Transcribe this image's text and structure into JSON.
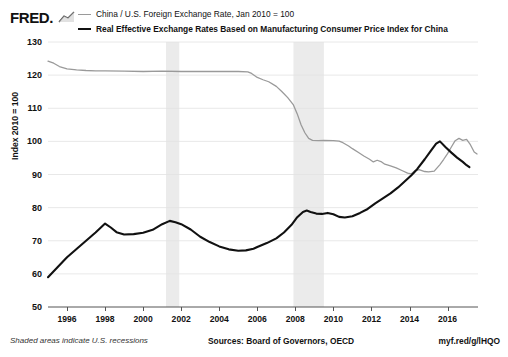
{
  "brand": {
    "name": "FRED.",
    "mark_icon": "trend-line-icon"
  },
  "legend": {
    "items": [
      {
        "label": "China / U.S. Foreign Exchange Rate, Jan 2010 = 100",
        "color": "#9a9a9a",
        "style": "thin"
      },
      {
        "label": "Real Effective Exchange Rates Based on Manufacturing Consumer Price Index for China",
        "color": "#111111",
        "style": "thick"
      }
    ]
  },
  "footer": {
    "recession_note": "Shaded areas indicate U.S. recessions",
    "sources": "Sources: Board of Governors, OECD",
    "permalink": "myf.red/g/lHQO"
  },
  "chart_data": {
    "type": "line",
    "title": "",
    "xlabel": "",
    "ylabel": "Index 2010 = 100",
    "ylim": [
      50,
      130
    ],
    "yticks": [
      50,
      60,
      70,
      80,
      90,
      100,
      110,
      120,
      130
    ],
    "xlim": [
      1995.0,
      2017.6
    ],
    "xticks": [
      1996,
      1998,
      2000,
      2002,
      2004,
      2006,
      2008,
      2010,
      2012,
      2014,
      2016
    ],
    "grid": true,
    "legend_position": "top",
    "shaded_regions": [
      {
        "label": "U.S. recession 2001",
        "x0": 2001.2,
        "x1": 2001.9,
        "color": "#ebebeb"
      },
      {
        "label": "U.S. recession 2007-2009",
        "x0": 2007.9,
        "x1": 2009.5,
        "color": "#ebebeb"
      }
    ],
    "series": [
      {
        "name": "China / U.S. Foreign Exchange Rate, Jan 2010 = 100",
        "color": "#9a9a9a",
        "width": 1.3,
        "points": [
          [
            1995.0,
            124.2
          ],
          [
            1995.3,
            123.6
          ],
          [
            1995.6,
            122.6
          ],
          [
            1996.0,
            121.9
          ],
          [
            1996.5,
            121.6
          ],
          [
            1997.0,
            121.4
          ],
          [
            1997.5,
            121.3
          ],
          [
            1998.0,
            121.3
          ],
          [
            1999.0,
            121.2
          ],
          [
            2000.0,
            121.1
          ],
          [
            2001.0,
            121.2
          ],
          [
            2002.0,
            121.1
          ],
          [
            2003.0,
            121.1
          ],
          [
            2004.0,
            121.1
          ],
          [
            2005.0,
            121.1
          ],
          [
            2005.5,
            121.0
          ],
          [
            2005.7,
            120.5
          ],
          [
            2006.0,
            119.3
          ],
          [
            2006.3,
            118.6
          ],
          [
            2006.6,
            118.0
          ],
          [
            2007.0,
            116.6
          ],
          [
            2007.3,
            115.0
          ],
          [
            2007.6,
            113.2
          ],
          [
            2007.9,
            111.0
          ],
          [
            2008.1,
            108.3
          ],
          [
            2008.3,
            105.0
          ],
          [
            2008.5,
            102.6
          ],
          [
            2008.7,
            100.9
          ],
          [
            2008.9,
            100.3
          ],
          [
            2009.2,
            100.2
          ],
          [
            2009.5,
            100.3
          ],
          [
            2010.0,
            100.2
          ],
          [
            2010.3,
            100.1
          ],
          [
            2010.5,
            99.6
          ],
          [
            2010.8,
            98.6
          ],
          [
            2011.0,
            97.8
          ],
          [
            2011.3,
            96.7
          ],
          [
            2011.6,
            95.6
          ],
          [
            2011.9,
            94.6
          ],
          [
            2012.1,
            93.8
          ],
          [
            2012.3,
            94.3
          ],
          [
            2012.5,
            93.9
          ],
          [
            2012.7,
            93.1
          ],
          [
            2013.0,
            92.6
          ],
          [
            2013.3,
            92.0
          ],
          [
            2013.6,
            91.2
          ],
          [
            2013.9,
            90.4
          ],
          [
            2014.1,
            90.2
          ],
          [
            2014.3,
            91.2
          ],
          [
            2014.5,
            91.5
          ],
          [
            2014.8,
            90.9
          ],
          [
            2015.0,
            90.8
          ],
          [
            2015.3,
            91.0
          ],
          [
            2015.6,
            93.0
          ],
          [
            2015.8,
            94.6
          ],
          [
            2016.0,
            96.3
          ],
          [
            2016.2,
            98.3
          ],
          [
            2016.4,
            100.2
          ],
          [
            2016.6,
            100.9
          ],
          [
            2016.8,
            100.3
          ],
          [
            2017.0,
            100.6
          ],
          [
            2017.2,
            99.0
          ],
          [
            2017.4,
            96.8
          ],
          [
            2017.55,
            96.2
          ]
        ]
      },
      {
        "name": "Real Effective Exchange Rates Based on Manufacturing Consumer Price Index for China",
        "color": "#111111",
        "width": 2.1,
        "points": [
          [
            1995.0,
            59.0
          ],
          [
            1995.5,
            62.0
          ],
          [
            1996.0,
            65.0
          ],
          [
            1996.5,
            67.5
          ],
          [
            1997.0,
            70.0
          ],
          [
            1997.5,
            72.5
          ],
          [
            1998.0,
            75.2
          ],
          [
            1998.3,
            74.0
          ],
          [
            1998.6,
            72.6
          ],
          [
            1999.0,
            71.9
          ],
          [
            1999.5,
            72.0
          ],
          [
            2000.0,
            72.4
          ],
          [
            2000.5,
            73.3
          ],
          [
            2001.0,
            75.0
          ],
          [
            2001.4,
            76.0
          ],
          [
            2001.7,
            75.6
          ],
          [
            2002.0,
            75.0
          ],
          [
            2002.5,
            73.4
          ],
          [
            2003.0,
            71.2
          ],
          [
            2003.5,
            69.6
          ],
          [
            2004.0,
            68.3
          ],
          [
            2004.5,
            67.4
          ],
          [
            2005.0,
            67.0
          ],
          [
            2005.4,
            67.1
          ],
          [
            2005.8,
            67.6
          ],
          [
            2006.0,
            68.1
          ],
          [
            2006.5,
            69.3
          ],
          [
            2007.0,
            70.7
          ],
          [
            2007.4,
            72.5
          ],
          [
            2007.8,
            74.8
          ],
          [
            2008.1,
            77.1
          ],
          [
            2008.4,
            78.7
          ],
          [
            2008.6,
            79.1
          ],
          [
            2008.8,
            78.7
          ],
          [
            2009.1,
            78.2
          ],
          [
            2009.4,
            78.1
          ],
          [
            2009.7,
            78.4
          ],
          [
            2010.0,
            78.0
          ],
          [
            2010.3,
            77.2
          ],
          [
            2010.6,
            77.0
          ],
          [
            2011.0,
            77.4
          ],
          [
            2011.4,
            78.4
          ],
          [
            2011.8,
            79.6
          ],
          [
            2012.2,
            81.3
          ],
          [
            2012.6,
            82.8
          ],
          [
            2013.0,
            84.3
          ],
          [
            2013.4,
            86.1
          ],
          [
            2013.8,
            88.2
          ],
          [
            2014.1,
            89.8
          ],
          [
            2014.4,
            91.6
          ],
          [
            2014.8,
            94.6
          ],
          [
            2015.1,
            97.0
          ],
          [
            2015.4,
            99.3
          ],
          [
            2015.6,
            100.0
          ],
          [
            2015.9,
            98.2
          ],
          [
            2016.2,
            96.6
          ],
          [
            2016.5,
            95.1
          ],
          [
            2016.8,
            93.8
          ],
          [
            2017.0,
            92.8
          ],
          [
            2017.15,
            92.2
          ]
        ]
      }
    ]
  }
}
